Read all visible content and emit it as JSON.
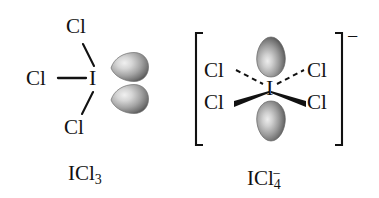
{
  "figure": {
    "background_color": "#ffffff",
    "bond_color": "#111111",
    "atom_label_color": "#111111",
    "lobe_color": "#8a8a8a"
  },
  "structures": [
    {
      "id": "icl3",
      "formula_label": "ICl",
      "formula_subscript": "3",
      "formula_charge": "",
      "central_atom": "I",
      "geometry": "T-shaped",
      "has_brackets": false,
      "charge_sign": "",
      "ligands": [
        {
          "label": "Cl",
          "position": "top",
          "bond_style": "plain"
        },
        {
          "label": "Cl",
          "position": "left",
          "bond_style": "plain"
        },
        {
          "label": "Cl",
          "position": "bottom",
          "bond_style": "plain"
        }
      ],
      "lone_pairs": [
        {
          "position": "upper-right",
          "orientation": "horizontal"
        },
        {
          "position": "lower-right",
          "orientation": "horizontal"
        }
      ]
    },
    {
      "id": "icl4",
      "formula_label": "ICl",
      "formula_subscript": "4",
      "formula_charge": "−",
      "central_atom": "I",
      "geometry": "square planar",
      "has_brackets": true,
      "charge_sign": "−",
      "ligands": [
        {
          "label": "Cl",
          "position": "upper-left",
          "bond_style": "dashed"
        },
        {
          "label": "Cl",
          "position": "upper-right",
          "bond_style": "dashed"
        },
        {
          "label": "Cl",
          "position": "lower-left",
          "bond_style": "wedge"
        },
        {
          "label": "Cl",
          "position": "lower-right",
          "bond_style": "wedge"
        }
      ],
      "lone_pairs": [
        {
          "position": "top",
          "orientation": "vertical"
        },
        {
          "position": "bottom",
          "orientation": "vertical"
        }
      ]
    }
  ]
}
